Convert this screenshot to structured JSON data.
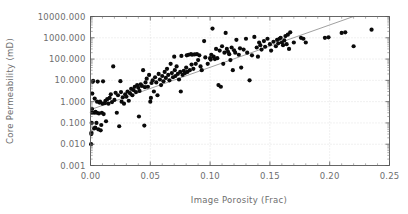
{
  "chart_data": {
    "type": "scatter",
    "title": "",
    "xlabel": "Image Porosity (Frac)",
    "ylabel": "Core Permeability (mD)",
    "xlim": [
      0.0,
      0.25
    ],
    "ylim": [
      0.001,
      10000.0
    ],
    "yscale": "log",
    "xscale": "linear",
    "grid": true,
    "legend": "none",
    "xticks": [
      0.0,
      0.05,
      0.1,
      0.15,
      0.2,
      0.25
    ],
    "xtick_labels": [
      "0.00",
      "0.05",
      "0.10",
      "0.15",
      "0.20",
      "0.25"
    ],
    "yticks": [
      0.001,
      0.01,
      0.1,
      1.0,
      10.0,
      100.0,
      1000.0,
      10000.0
    ],
    "ytick_labels": [
      "0.001",
      "0.010",
      "0.100",
      "1.000",
      "10.000",
      "100.000",
      "1000.000",
      "10000.000"
    ],
    "series": [
      {
        "name": "core samples",
        "marker": "filled-circle",
        "color": "#0a0a0a",
        "points": [
          [
            0.0005,
            0.01
          ],
          [
            0.0007,
            0.03
          ],
          [
            0.0008,
            0.035
          ],
          [
            0.001,
            0.1
          ],
          [
            0.0012,
            0.3
          ],
          [
            0.0013,
            0.45
          ],
          [
            0.0015,
            2.4
          ],
          [
            0.0018,
            8.5
          ],
          [
            0.0022,
            9.5
          ],
          [
            0.003,
            0.055
          ],
          [
            0.0032,
            0.3
          ],
          [
            0.0035,
            1.4
          ],
          [
            0.004,
            0.06
          ],
          [
            0.0042,
            0.33
          ],
          [
            0.005,
            0.1
          ],
          [
            0.0052,
            0.3
          ],
          [
            0.0055,
            1.0
          ],
          [
            0.006,
            8.8
          ],
          [
            0.0065,
            0.05
          ],
          [
            0.007,
            0.28
          ],
          [
            0.0075,
            0.9
          ],
          [
            0.008,
            1.0
          ],
          [
            0.0085,
            0.045
          ],
          [
            0.009,
            0.08
          ],
          [
            0.0095,
            0.3
          ],
          [
            0.01,
            0.8
          ],
          [
            0.0105,
            9.0
          ],
          [
            0.011,
            0.26
          ],
          [
            0.012,
            0.85
          ],
          [
            0.0125,
            1.1
          ],
          [
            0.013,
            0.12
          ],
          [
            0.014,
            1.3
          ],
          [
            0.015,
            0.8
          ],
          [
            0.016,
            1.5
          ],
          [
            0.017,
            2.2
          ],
          [
            0.018,
            0.95
          ],
          [
            0.019,
            45.0
          ],
          [
            0.02,
            1.2
          ],
          [
            0.021,
            2.6
          ],
          [
            0.022,
            0.3
          ],
          [
            0.023,
            2.0
          ],
          [
            0.024,
            0.07
          ],
          [
            0.025,
            9.2
          ],
          [
            0.0255,
            2.8
          ],
          [
            0.026,
            1.0
          ],
          [
            0.027,
            1.6
          ],
          [
            0.028,
            0.8
          ],
          [
            0.029,
            2.2
          ],
          [
            0.03,
            1.7
          ],
          [
            0.031,
            3.0
          ],
          [
            0.032,
            1.1
          ],
          [
            0.033,
            2.5
          ],
          [
            0.034,
            4.0
          ],
          [
            0.035,
            2.0
          ],
          [
            0.036,
            3.5
          ],
          [
            0.037,
            5.0
          ],
          [
            0.038,
            2.8
          ],
          [
            0.039,
            6.0
          ],
          [
            0.04,
            4.5
          ],
          [
            0.0405,
            0.2
          ],
          [
            0.041,
            3.2
          ],
          [
            0.042,
            6.5
          ],
          [
            0.043,
            5.5
          ],
          [
            0.044,
            30.0
          ],
          [
            0.045,
            0.075
          ],
          [
            0.0455,
            4.8
          ],
          [
            0.046,
            8.0
          ],
          [
            0.047,
            12.0
          ],
          [
            0.048,
            5.0
          ],
          [
            0.049,
            18.0
          ],
          [
            0.05,
            1.0
          ],
          [
            0.0505,
            1.5
          ],
          [
            0.051,
            7.5
          ],
          [
            0.052,
            10.0
          ],
          [
            0.053,
            3.0
          ],
          [
            0.054,
            14.0
          ],
          [
            0.055,
            8.0
          ],
          [
            0.056,
            2.0
          ],
          [
            0.057,
            20.0
          ],
          [
            0.058,
            11.0
          ],
          [
            0.059,
            6.0
          ],
          [
            0.06,
            16.0
          ],
          [
            0.061,
            9.0
          ],
          [
            0.062,
            25.0
          ],
          [
            0.063,
            13.0
          ],
          [
            0.064,
            35.0
          ],
          [
            0.065,
            18.0
          ],
          [
            0.066,
            10.0
          ],
          [
            0.067,
            60.0
          ],
          [
            0.068,
            22.0
          ],
          [
            0.069,
            14.0
          ],
          [
            0.07,
            130.0
          ],
          [
            0.0705,
            30.0
          ],
          [
            0.071,
            16.0
          ],
          [
            0.072,
            45.0
          ],
          [
            0.073,
            20.0
          ],
          [
            0.074,
            11.0
          ],
          [
            0.075,
            25.0
          ],
          [
            0.0755,
            3.0
          ],
          [
            0.076,
            140.0
          ],
          [
            0.077,
            18.0
          ],
          [
            0.078,
            28.0
          ],
          [
            0.079,
            22.0
          ],
          [
            0.08,
            40.0
          ],
          [
            0.0805,
            150.0
          ],
          [
            0.081,
            25.0
          ],
          [
            0.082,
            160.0
          ],
          [
            0.083,
            30.0
          ],
          [
            0.084,
            170.0
          ],
          [
            0.0845,
            55.0
          ],
          [
            0.085,
            160.0
          ],
          [
            0.086,
            35.0
          ],
          [
            0.087,
            165.0
          ],
          [
            0.088,
            60.0
          ],
          [
            0.089,
            170.0
          ],
          [
            0.09,
            90.0
          ],
          [
            0.091,
            150.0
          ],
          [
            0.092,
            45.0
          ],
          [
            0.093,
            30.0
          ],
          [
            0.095,
            700.0
          ],
          [
            0.096,
            120.0
          ],
          [
            0.098,
            60.0
          ],
          [
            0.1,
            110.0
          ],
          [
            0.1005,
            95.0
          ],
          [
            0.101,
            160.0
          ],
          [
            0.102,
            2700.0
          ],
          [
            0.103,
            130.0
          ],
          [
            0.104,
            100.0
          ],
          [
            0.105,
            300.0
          ],
          [
            0.106,
            110.0
          ],
          [
            0.107,
            6.0
          ],
          [
            0.108,
            250.0
          ],
          [
            0.109,
            5.0
          ],
          [
            0.11,
            400.0
          ],
          [
            0.111,
            60.0
          ],
          [
            0.112,
            200.0
          ],
          [
            0.113,
            1700.0
          ],
          [
            0.114,
            300.0
          ],
          [
            0.115,
            220.0
          ],
          [
            0.116,
            170.0
          ],
          [
            0.117,
            90.0
          ],
          [
            0.118,
            350.0
          ],
          [
            0.119,
            30.0
          ],
          [
            0.12,
            260.0
          ],
          [
            0.121,
            200.0
          ],
          [
            0.122,
            800.0
          ],
          [
            0.124,
            160.0
          ],
          [
            0.125,
            320.0
          ],
          [
            0.126,
            40.0
          ],
          [
            0.128,
            280.0
          ],
          [
            0.13,
            900.0
          ],
          [
            0.131,
            200.0
          ],
          [
            0.133,
            10.0
          ],
          [
            0.135,
            150.0
          ],
          [
            0.137,
            1100.0
          ],
          [
            0.139,
            350.0
          ],
          [
            0.14,
            130.0
          ],
          [
            0.141,
            600.0
          ],
          [
            0.142,
            450.0
          ],
          [
            0.143,
            280.0
          ],
          [
            0.145,
            700.0
          ],
          [
            0.146,
            380.0
          ],
          [
            0.148,
            900.0
          ],
          [
            0.15,
            500.0
          ],
          [
            0.151,
            250.0
          ],
          [
            0.153,
            650.0
          ],
          [
            0.155,
            400.0
          ],
          [
            0.156,
            800.0
          ],
          [
            0.157,
            550.0
          ],
          [
            0.158,
            900.0
          ],
          [
            0.159,
            1000.0
          ],
          [
            0.16,
            600.0
          ],
          [
            0.161,
            450.0
          ],
          [
            0.162,
            750.0
          ],
          [
            0.163,
            1200.0
          ],
          [
            0.164,
            500.0
          ],
          [
            0.165,
            1400.0
          ],
          [
            0.166,
            300.0
          ],
          [
            0.167,
            1800.0
          ],
          [
            0.17,
            600.0
          ],
          [
            0.176,
            1000.0
          ],
          [
            0.178,
            900.0
          ],
          [
            0.18,
            600.0
          ],
          [
            0.196,
            1000.0
          ],
          [
            0.199,
            1050.0
          ],
          [
            0.21,
            1700.0
          ],
          [
            0.213,
            1800.0
          ],
          [
            0.22,
            400.0
          ],
          [
            0.235,
            2400.0
          ]
        ]
      }
    ],
    "fit_line": {
      "name": "trend-line",
      "color": "#888888",
      "x_start": 0.0,
      "y_start": 0.42,
      "x_end": 0.222,
      "y_end": 11000.0
    }
  }
}
